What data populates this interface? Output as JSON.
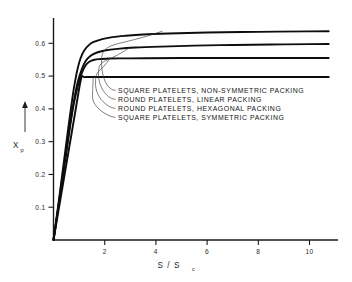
{
  "chart_data": {
    "type": "line",
    "title": "",
    "xlabel": "S / Sc",
    "xlabel_main": "S / S",
    "xlabel_sub": "c",
    "ylabel": "Xp",
    "ylabel_main": "X",
    "ylabel_sub": "p",
    "xlim": [
      0,
      10.8
    ],
    "ylim": [
      0,
      0.665
    ],
    "xticks": [
      2,
      4,
      6,
      8,
      10
    ],
    "xtick_labels": [
      "2",
      "4",
      "6",
      "8",
      "10"
    ],
    "yticks": [
      0.1,
      0.2,
      0.3,
      0.4,
      0.5,
      0.6
    ],
    "ytick_labels": [
      "0.1",
      "0.2",
      "0.3",
      "0.4",
      "0.5",
      "0.6"
    ],
    "grid": false,
    "legend_position": "inside-center-left",
    "series": [
      {
        "name": "SQUARE PLATELETS, NON-SYMMETRIC PACKING",
        "plateau": 0.637,
        "x": [
          0,
          0.2,
          0.4,
          0.6,
          0.75,
          0.85,
          0.95,
          1.05,
          1.2,
          1.4,
          1.6,
          1.9,
          2.3,
          2.8,
          3.5,
          4.5,
          6.0,
          8.0,
          10.0,
          10.75
        ],
        "y": [
          0,
          0.115,
          0.235,
          0.355,
          0.44,
          0.487,
          0.525,
          0.553,
          0.578,
          0.596,
          0.605,
          0.613,
          0.619,
          0.623,
          0.627,
          0.63,
          0.633,
          0.635,
          0.6365,
          0.637
        ]
      },
      {
        "name": "ROUND PLATELETS, LINEAR PACKING",
        "plateau": 0.598,
        "x": [
          0,
          0.2,
          0.4,
          0.6,
          0.8,
          0.95,
          1.1,
          1.25,
          1.45,
          1.7,
          2.0,
          2.5,
          3.2,
          4.2,
          5.5,
          7.0,
          8.5,
          10.0,
          10.75
        ],
        "y": [
          0,
          0.108,
          0.22,
          0.33,
          0.425,
          0.483,
          0.52,
          0.545,
          0.562,
          0.572,
          0.578,
          0.583,
          0.587,
          0.59,
          0.593,
          0.595,
          0.5965,
          0.5975,
          0.598
        ]
      },
      {
        "name": "ROUND PLATELETS, HEXAGONAL PACKING",
        "plateau": 0.555,
        "x": [
          0,
          0.25,
          0.5,
          0.75,
          0.95,
          1.1,
          1.25,
          1.4,
          1.6,
          1.85,
          2.2,
          2.8,
          3.6,
          5.0,
          7.0,
          9.0,
          10.75
        ],
        "y": [
          0,
          0.132,
          0.265,
          0.398,
          0.47,
          0.508,
          0.532,
          0.544,
          0.55,
          0.552,
          0.5535,
          0.554,
          0.5545,
          0.555,
          0.555,
          0.555,
          0.555
        ]
      },
      {
        "name": "SQUARE PLATELETS, SYMMETRIC PACKING",
        "plateau": 0.497,
        "x": [
          0,
          0.3,
          0.6,
          0.9,
          1.08,
          1.2,
          1.5,
          2.5,
          4.0,
          6.0,
          8.0,
          10.75
        ],
        "y": [
          0,
          0.138,
          0.276,
          0.414,
          0.493,
          0.497,
          0.497,
          0.497,
          0.497,
          0.497,
          0.497,
          0.497
        ]
      }
    ],
    "legend_entries": [
      {
        "label": "SQUARE PLATELETS, NON-SYMMETRIC PACKING",
        "anchor_x": 4.25,
        "anchor_y": 0.637
      },
      {
        "label": "ROUND PLATELETS, LINEAR PACKING",
        "anchor_x": 2.95,
        "anchor_y": 0.586
      },
      {
        "label": "ROUND PLATELETS, HEXAGONAL PACKING",
        "anchor_x": 2.2,
        "anchor_y": 0.5535
      },
      {
        "label": "SQUARE PLATELETS, SYMMETRIC PACKING",
        "anchor_x": 1.55,
        "anchor_y": 0.497
      }
    ]
  }
}
